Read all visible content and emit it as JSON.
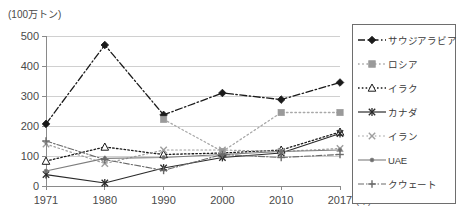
{
  "axis": {
    "unit_label": "(100万トン)",
    "x_unit": "(年)",
    "y_ticks": [
      "0",
      "100",
      "200",
      "300",
      "400",
      "500"
    ],
    "x_ticks": [
      "1971",
      "1980",
      "1990",
      "2000",
      "2010",
      "2017"
    ]
  },
  "legend": {
    "items": [
      {
        "label": "サウジアラビア",
        "marker": "filled-diamond-icon",
        "line": "dashdot"
      },
      {
        "label": "ロシア",
        "marker": "filled-square-icon",
        "line": "dotted"
      },
      {
        "label": "イラク",
        "marker": "hollow-triangle-icon",
        "line": "dotted"
      },
      {
        "label": "カナダ",
        "marker": "star-icon",
        "line": "solid"
      },
      {
        "label": "イラン",
        "marker": "cross-icon",
        "line": "dotted"
      },
      {
        "label": "UAE",
        "marker": "small-dot-icon",
        "line": "solid"
      },
      {
        "label": "クウェート",
        "marker": "plus-icon",
        "line": "dashdot"
      }
    ]
  },
  "chart_data": {
    "type": "line",
    "title": "",
    "xlabel": "(年)",
    "ylabel": "(100万トン)",
    "x": [
      1971,
      1980,
      1990,
      2000,
      2010,
      2017
    ],
    "xlim": [
      1971,
      2017
    ],
    "ylim": [
      0,
      500
    ],
    "yticks": [
      0,
      100,
      200,
      300,
      400,
      500
    ],
    "grid": true,
    "legend_position": "right",
    "series": [
      {
        "name": "サウジアラビア",
        "values": [
          207,
          470,
          237,
          310,
          288,
          345
        ]
      },
      {
        "name": "ロシア",
        "values": [
          null,
          null,
          222,
          115,
          245,
          245
        ]
      },
      {
        "name": "イラク",
        "values": [
          83,
          130,
          105,
          110,
          120,
          180
        ]
      },
      {
        "name": "カナダ",
        "values": [
          38,
          10,
          60,
          95,
          110,
          175
        ]
      },
      {
        "name": "イラン",
        "values": [
          140,
          75,
          120,
          120,
          115,
          125
        ]
      },
      {
        "name": "UAE",
        "values": [
          50,
          92,
          95,
          105,
          115,
          120
        ]
      },
      {
        "name": "クウェート",
        "values": [
          150,
          88,
          52,
          105,
          95,
          105
        ]
      }
    ]
  }
}
